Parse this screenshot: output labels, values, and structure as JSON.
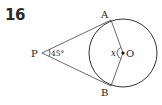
{
  "problem": {
    "number": "16"
  },
  "diagram": {
    "points": {
      "P": {
        "label": "P"
      },
      "A": {
        "label": "A"
      },
      "B": {
        "label": "B"
      },
      "O": {
        "label": "O"
      }
    },
    "angle_P": "45°",
    "angle_O": "x",
    "colors": {
      "stroke": "#333333",
      "text": "#222222"
    }
  }
}
